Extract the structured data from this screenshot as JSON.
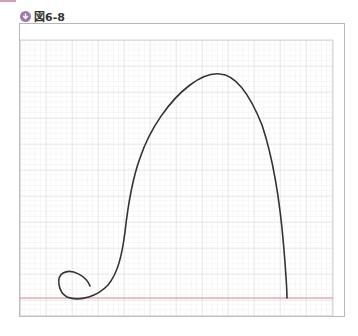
{
  "figure": {
    "label": "図6-8",
    "icon": "download-arrow-icon",
    "accent_color": "#9b7bb0",
    "curve_color": "#333333",
    "baseline_color": "#d9868e",
    "grid_minor_color": "#e4e8e4",
    "grid_major_color": "#c9cec9"
  }
}
